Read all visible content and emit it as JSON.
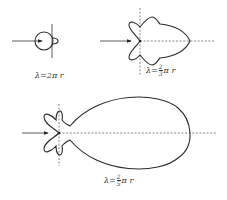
{
  "figures": [
    {
      "id": "pattern-1",
      "label_prefix": "λ=2",
      "label_suffix": "π r",
      "description": "small circular pattern with tiny back lobe"
    },
    {
      "id": "pattern-2",
      "label_prefix": "λ=",
      "numerator": "2",
      "denominator": "3",
      "label_suffix": "π r",
      "description": "multi-lobe pattern, moderate main lobe"
    },
    {
      "id": "pattern-3",
      "label_prefix": "λ=",
      "numerator": "2",
      "denominator": "5",
      "label_suffix": "π r",
      "description": "large elongated main lobe with side lobes"
    }
  ],
  "colors": {
    "line": "#2a2a2a",
    "axis": "#555555",
    "background": "#ffffff"
  }
}
